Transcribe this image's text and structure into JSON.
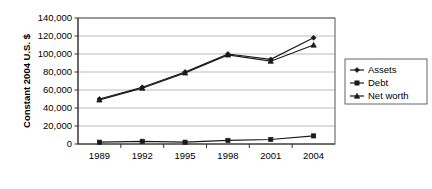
{
  "chart_data": {
    "type": "line",
    "title": "",
    "xlabel": "",
    "ylabel": "Constant 2004 U.S. $",
    "categories": [
      "1989",
      "1992",
      "1995",
      "1998",
      "2001",
      "2004"
    ],
    "ylim": [
      0,
      140000
    ],
    "ytick_labels": [
      "0",
      "20,000",
      "40,000",
      "60,000",
      "80,000",
      "100,000",
      "120,000",
      "140,000"
    ],
    "ytick_values": [
      0,
      20000,
      40000,
      60000,
      80000,
      100000,
      120000,
      140000
    ],
    "grid": true,
    "legend_position": "right",
    "series": [
      {
        "name": "Assets",
        "marker": "diamond",
        "values": [
          50000,
          63000,
          80000,
          100000,
          94000,
          118000
        ]
      },
      {
        "name": "Debt",
        "marker": "square",
        "values": [
          2000,
          3000,
          2000,
          4000,
          5000,
          9000
        ]
      },
      {
        "name": "Net worth",
        "marker": "triangle",
        "values": [
          49000,
          62000,
          79000,
          99000,
          92000,
          110000
        ]
      }
    ]
  },
  "colors": {
    "series": "#1a1a1a",
    "grid": "#aaaaaa",
    "frame": "#555555",
    "axis": "#333333",
    "background": "#ffffff"
  },
  "legend": {
    "items": [
      {
        "label": "Assets",
        "marker": "diamond"
      },
      {
        "label": "Debt",
        "marker": "square"
      },
      {
        "label": "Net worth",
        "marker": "triangle"
      }
    ]
  }
}
